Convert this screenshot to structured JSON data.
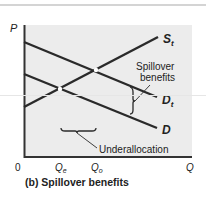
{
  "figure": {
    "caption": "(b) Spillover benefits",
    "axes": {
      "y_label": "P",
      "x_label": "Q",
      "origin_label": "0",
      "x_ticks": [
        {
          "label": "Q",
          "sub": "e"
        },
        {
          "label": "Q",
          "sub": "o"
        }
      ]
    },
    "curves": [
      {
        "id": "supply",
        "label": "S",
        "sub": "t"
      },
      {
        "id": "total-demand",
        "label": "D",
        "sub": "t"
      },
      {
        "id": "demand",
        "label": "D",
        "sub": ""
      }
    ],
    "annotations": {
      "spillover_line1": "Spillover",
      "spillover_line2": "benefits",
      "underallocation": "Underallocation"
    },
    "colors": {
      "panel": "#ececec",
      "line": "#2a2a2a",
      "text": "#222222"
    }
  }
}
